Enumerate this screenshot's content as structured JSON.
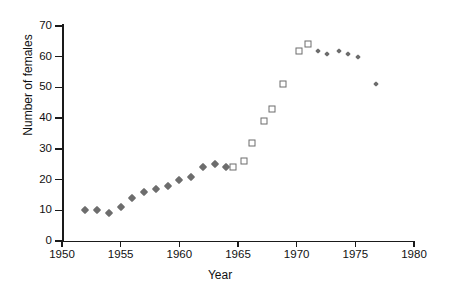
{
  "chart_data": {
    "type": "scatter",
    "title": "",
    "xlabel": "Year",
    "ylabel": "Number of females",
    "xlim": [
      1950,
      1980
    ],
    "ylim": [
      0,
      70
    ],
    "xticks": [
      1950,
      1955,
      1960,
      1965,
      1970,
      1975,
      1980
    ],
    "yticks": [
      0,
      10,
      20,
      30,
      40,
      50,
      60,
      70
    ],
    "grid": false,
    "legend": "none",
    "series": [
      {
        "name": "filled-diamonds",
        "marker": "diamond-filled",
        "color": "#6d6d6d",
        "points": [
          {
            "x": 1952,
            "y": 10
          },
          {
            "x": 1953,
            "y": 10
          },
          {
            "x": 1954,
            "y": 9
          },
          {
            "x": 1955,
            "y": 11
          },
          {
            "x": 1956,
            "y": 14
          },
          {
            "x": 1957,
            "y": 16
          },
          {
            "x": 1958,
            "y": 17
          },
          {
            "x": 1959,
            "y": 18
          },
          {
            "x": 1960,
            "y": 20
          },
          {
            "x": 1961,
            "y": 21
          },
          {
            "x": 1962,
            "y": 24
          },
          {
            "x": 1963,
            "y": 25
          },
          {
            "x": 1964,
            "y": 24
          }
        ]
      },
      {
        "name": "open-squares",
        "marker": "square-open",
        "color": "#6d6d6d",
        "points": [
          {
            "x": 1964.6,
            "y": 24
          },
          {
            "x": 1965.5,
            "y": 26
          },
          {
            "x": 1966.2,
            "y": 32
          },
          {
            "x": 1967.2,
            "y": 39
          },
          {
            "x": 1967.9,
            "y": 43
          },
          {
            "x": 1968.8,
            "y": 51
          },
          {
            "x": 1970.2,
            "y": 62
          },
          {
            "x": 1971.0,
            "y": 64
          }
        ]
      },
      {
        "name": "small-dots",
        "marker": "dot-filled",
        "color": "#6d6d6d",
        "points": [
          {
            "x": 1971.8,
            "y": 62
          },
          {
            "x": 1972.6,
            "y": 61
          },
          {
            "x": 1973.6,
            "y": 62
          },
          {
            "x": 1974.4,
            "y": 61
          },
          {
            "x": 1975.2,
            "y": 60
          },
          {
            "x": 1976.8,
            "y": 51
          }
        ]
      }
    ]
  },
  "axes": {
    "y_title": "Number of females",
    "x_title": "Year",
    "y_tick_labels": [
      "0",
      "10",
      "20",
      "30",
      "40",
      "50",
      "60",
      "70"
    ],
    "x_tick_labels": [
      "1950",
      "1955",
      "1960",
      "1965",
      "1970",
      "1975",
      "1980"
    ]
  },
  "style": {
    "axis_color": "#1a1a1a",
    "marker_color": "#6d6d6d",
    "background": "#ffffff"
  }
}
